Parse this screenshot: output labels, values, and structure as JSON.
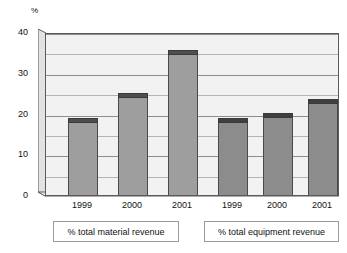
{
  "chart_data": {
    "type": "bar",
    "title": "",
    "subtitle": "",
    "xlabel": "",
    "ylabel": "%",
    "ylim": [
      0,
      40
    ],
    "y_ticks": [
      0,
      10,
      20,
      30,
      40
    ],
    "y_gridlines": [
      0,
      5,
      10,
      15,
      20,
      25,
      30,
      35,
      40
    ],
    "grid": true,
    "legend_position": "below-axis-boxes",
    "categories": [
      "1999",
      "2000",
      "2001"
    ],
    "groups": [
      {
        "name": "% total material revenue",
        "categories": [
          "1999",
          "2000",
          "2001"
        ],
        "values": [
          19,
          25,
          35.5
        ],
        "color": "#9e9e9e"
      },
      {
        "name": "% total equipment revenue",
        "categories": [
          "1999",
          "2000",
          "2001"
        ],
        "values": [
          19,
          20,
          23.5
        ],
        "color": "#8c8c8c"
      }
    ],
    "series": [
      {
        "name": "% total material revenue",
        "values": [
          19,
          25,
          35.5
        ]
      },
      {
        "name": "% total equipment revenue",
        "values": [
          19,
          20,
          23.5
        ]
      }
    ]
  },
  "axis": {
    "unit_label": "%",
    "y_tick_labels": [
      "40",
      "30",
      "20",
      "10",
      "0"
    ],
    "x_tick_labels_group1": [
      "1999",
      "2000",
      "2001"
    ],
    "x_tick_labels_group2": [
      "1999",
      "2000",
      "2001"
    ]
  },
  "captions": {
    "material": "% total material revenue",
    "equipment": "% total equipment revenue"
  },
  "colors": {
    "background": "#ffffff",
    "plot_face": "#f2f2f2",
    "axis_line": "#5a5a5a",
    "gridline_major": "#8d8d8d",
    "gridline_minor": "#b4b4b4",
    "bar_material": "#9e9e9e",
    "bar_material_cap": "#4e4e4e",
    "bar_equipment": "#8c8c8c",
    "bar_equipment_cap": "#3f3f3f",
    "text": "#111111"
  }
}
